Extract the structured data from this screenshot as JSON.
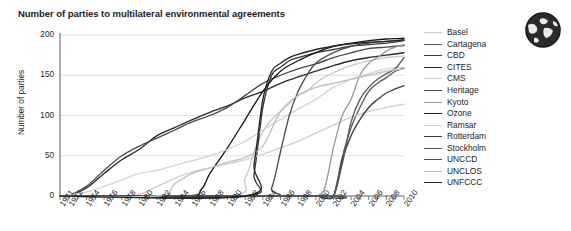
{
  "chart_data": {
    "type": "line",
    "title": "Number of parties to multilateral environmental agreements",
    "xlabel": "",
    "ylabel": "Number of parties",
    "xlim": [
      1971,
      2010
    ],
    "ylim": [
      0,
      200
    ],
    "yticks": [
      0,
      50,
      100,
      150,
      200
    ],
    "xticks": [
      1971,
      1972,
      1974,
      1976,
      1978,
      1980,
      1982,
      1984,
      1986,
      1988,
      1990,
      1992,
      1994,
      1996,
      1998,
      2000,
      2002,
      2004,
      2006,
      2008,
      2010
    ],
    "grid": true,
    "legend_position": "right",
    "series": [
      {
        "name": "Basel",
        "color": "#c9c9c9",
        "x": [
          1971,
          1990,
          1992,
          1993,
          1994,
          1995,
          1996,
          1997,
          1998,
          1999,
          2000,
          2001,
          2002,
          2003,
          2004,
          2005,
          2006,
          2007,
          2008,
          2009,
          2010
        ],
        "values": [
          0,
          0,
          22,
          55,
          80,
          95,
          105,
          115,
          125,
          130,
          140,
          148,
          153,
          158,
          162,
          165,
          168,
          170,
          172,
          173,
          174
        ]
      },
      {
        "name": "Cartagena",
        "color": "#5a5a5a",
        "x": [
          1971,
          2000,
          2001,
          2002,
          2003,
          2004,
          2005,
          2006,
          2007,
          2008,
          2009,
          2010
        ],
        "values": [
          0,
          0,
          0,
          0,
          48,
          85,
          110,
          130,
          140,
          147,
          155,
          159
        ]
      },
      {
        "name": "CBD",
        "color": "#3a3a3a",
        "x": [
          1971,
          1992,
          1993,
          1994,
          1995,
          1996,
          1997,
          1998,
          1999,
          2000,
          2002,
          2004,
          2006,
          2008,
          2010
        ],
        "values": [
          0,
          0,
          28,
          110,
          150,
          160,
          168,
          172,
          175,
          178,
          182,
          186,
          188,
          190,
          193
        ]
      },
      {
        "name": "CITES",
        "color": "#2a2a2a",
        "x": [
          1971,
          1972,
          1974,
          1976,
          1978,
          1980,
          1982,
          1984,
          1986,
          1988,
          1990,
          1992,
          1994,
          1996,
          1998,
          2000,
          2002,
          2004,
          2006,
          2008,
          2010
        ],
        "values": [
          0,
          0,
          10,
          28,
          45,
          58,
          75,
          85,
          95,
          104,
          112,
          122,
          130,
          140,
          148,
          155,
          162,
          168,
          172,
          175,
          178
        ]
      },
      {
        "name": "CMS",
        "color": "#cfcfcf",
        "x": [
          1971,
          1979,
          1982,
          1984,
          1986,
          1988,
          1990,
          1992,
          1994,
          1996,
          1998,
          2000,
          2002,
          2004,
          2006,
          2008,
          2010
        ],
        "values": [
          0,
          0,
          12,
          22,
          30,
          35,
          40,
          45,
          52,
          60,
          68,
          78,
          88,
          98,
          105,
          110,
          114
        ]
      },
      {
        "name": "Heritage",
        "color": "#4a4a4a",
        "x": [
          1971,
          1972,
          1974,
          1976,
          1978,
          1980,
          1982,
          1984,
          1986,
          1988,
          1990,
          1992,
          1994,
          1996,
          1998,
          2000,
          2002,
          2004,
          2006,
          2008,
          2010
        ],
        "values": [
          0,
          0,
          12,
          32,
          50,
          62,
          72,
          82,
          92,
          100,
          110,
          125,
          140,
          150,
          158,
          164,
          172,
          178,
          183,
          185,
          187
        ]
      },
      {
        "name": "Kyoto",
        "color": "#9a9a9a",
        "x": [
          1971,
          1998,
          1999,
          2000,
          2001,
          2002,
          2003,
          2004,
          2005,
          2006,
          2007,
          2008,
          2009,
          2010
        ],
        "values": [
          0,
          0,
          0,
          0,
          10,
          60,
          100,
          120,
          150,
          165,
          172,
          180,
          185,
          188
        ]
      },
      {
        "name": "Ozone",
        "color": "#1a1a1a",
        "x": [
          1971,
          1985,
          1987,
          1988,
          1990,
          1992,
          1994,
          1996,
          1998,
          2000,
          2002,
          2004,
          2006,
          2008,
          2010
        ],
        "values": [
          0,
          0,
          8,
          28,
          60,
          95,
          130,
          155,
          168,
          178,
          186,
          190,
          193,
          195,
          196
        ]
      },
      {
        "name": "Ramsar",
        "color": "#d4d4d4",
        "x": [
          1971,
          1974,
          1976,
          1978,
          1980,
          1982,
          1984,
          1986,
          1988,
          1990,
          1992,
          1994,
          1996,
          1998,
          2000,
          2002,
          2004,
          2006,
          2008,
          2010
        ],
        "values": [
          0,
          5,
          12,
          20,
          28,
          32,
          38,
          44,
          50,
          58,
          68,
          82,
          95,
          108,
          120,
          135,
          145,
          152,
          158,
          160
        ]
      },
      {
        "name": "Rotterdam",
        "color": "#3f3f3f",
        "x": [
          1971,
          1998,
          2000,
          2002,
          2003,
          2004,
          2005,
          2006,
          2007,
          2008,
          2009,
          2010
        ],
        "values": [
          0,
          0,
          0,
          0,
          45,
          75,
          95,
          110,
          120,
          128,
          133,
          137
        ]
      },
      {
        "name": "Stockholm",
        "color": "#585858",
        "x": [
          1971,
          2001,
          2002,
          2003,
          2004,
          2005,
          2006,
          2007,
          2008,
          2009,
          2010
        ],
        "values": [
          0,
          0,
          0,
          40,
          92,
          120,
          135,
          145,
          152,
          158,
          172
        ]
      },
      {
        "name": "UNCCD",
        "color": "#4e4e4e",
        "x": [
          1971,
          1994,
          1995,
          1996,
          1997,
          1998,
          1999,
          2000,
          2002,
          2004,
          2006,
          2008,
          2010
        ],
        "values": [
          0,
          0,
          10,
          55,
          100,
          130,
          150,
          165,
          178,
          186,
          190,
          192,
          194
        ]
      },
      {
        "name": "UNCLOS",
        "color": "#c0c0c0",
        "x": [
          1971,
          1982,
          1984,
          1986,
          1988,
          1990,
          1992,
          1994,
          1996,
          1998,
          2000,
          2002,
          2004,
          2006,
          2008,
          2010
        ],
        "values": [
          0,
          0,
          15,
          28,
          35,
          42,
          48,
          62,
          105,
          125,
          135,
          140,
          145,
          150,
          155,
          158
        ]
      },
      {
        "name": "UNFCCC",
        "color": "#242424",
        "x": [
          1971,
          1992,
          1993,
          1994,
          1995,
          1996,
          1997,
          1998,
          2000,
          2002,
          2004,
          2006,
          2008,
          2010
        ],
        "values": [
          0,
          0,
          40,
          120,
          155,
          165,
          172,
          176,
          182,
          186,
          189,
          191,
          192,
          194
        ]
      }
    ]
  },
  "legend": {
    "items": [
      {
        "label": "Basel"
      },
      {
        "label": "Cartagena"
      },
      {
        "label": "CBD"
      },
      {
        "label": "CITES"
      },
      {
        "label": "CMS"
      },
      {
        "label": "Heritage"
      },
      {
        "label": "Kyoto"
      },
      {
        "label": "Ozone"
      },
      {
        "label": "Ramsar"
      },
      {
        "label": "Rotterdam"
      },
      {
        "label": "Stockholm"
      },
      {
        "label": "UNCCD"
      },
      {
        "label": "UNCLOS"
      },
      {
        "label": "UNFCCC"
      }
    ]
  },
  "icons": {
    "globe": "globe-icon"
  },
  "colors": {
    "background": "#ffffff",
    "text": "#1c1c1c",
    "axis": "#6b6b6b",
    "grid": "#d8d8d8"
  }
}
